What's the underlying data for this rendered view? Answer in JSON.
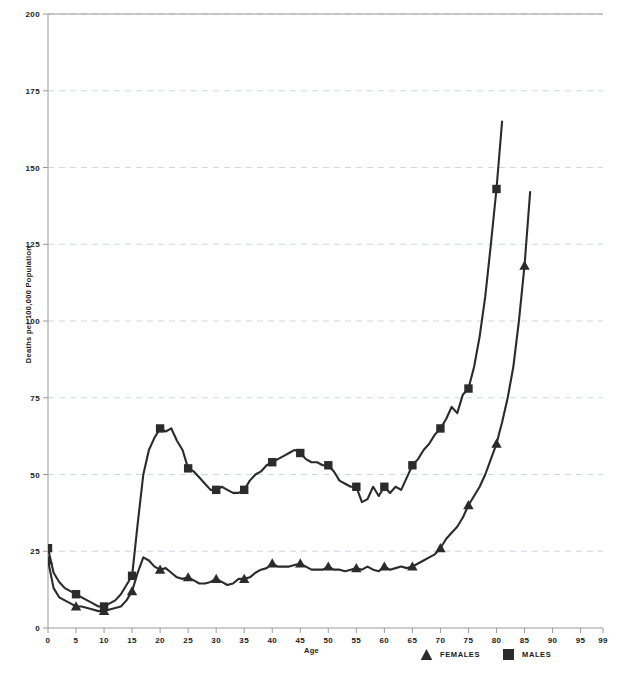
{
  "chart_data": {
    "type": "line",
    "title": "",
    "xlabel": "Age",
    "ylabel": "Deaths per 100,000 Population",
    "xlim": [
      0,
      99
    ],
    "ylim": [
      0,
      200
    ],
    "grid": true,
    "grid_axis": "y",
    "legend_position": "bottom-right",
    "xticks": [
      0,
      5,
      10,
      15,
      20,
      25,
      30,
      35,
      40,
      45,
      50,
      55,
      60,
      65,
      70,
      75,
      80,
      85,
      90,
      95,
      99
    ],
    "xticklabels": [
      "0",
      "5",
      "10",
      "15",
      "20",
      "25",
      "30",
      "35",
      "40",
      "45",
      "50",
      "55",
      "60",
      "65",
      "70",
      "75",
      "80",
      "85",
      "90",
      "95",
      "99"
    ],
    "yticks": [
      0,
      25,
      50,
      75,
      100,
      125,
      150,
      175,
      200
    ],
    "yticklabels": [
      "0",
      "25",
      "50",
      "75",
      "100",
      "125",
      "150",
      "175",
      "200"
    ],
    "series": [
      {
        "name": "FEMALES",
        "marker": "triangle",
        "color": "#2b2b2b",
        "marker_interval": 5,
        "x": [
          0,
          1,
          2,
          3,
          4,
          5,
          6,
          7,
          8,
          9,
          10,
          11,
          12,
          13,
          14,
          15,
          16,
          17,
          18,
          19,
          20,
          21,
          22,
          23,
          24,
          25,
          26,
          27,
          28,
          29,
          30,
          31,
          32,
          33,
          34,
          35,
          36,
          37,
          38,
          39,
          40,
          41,
          42,
          43,
          44,
          45,
          46,
          47,
          48,
          49,
          50,
          51,
          52,
          53,
          54,
          55,
          56,
          57,
          58,
          59,
          60,
          61,
          62,
          63,
          64,
          65,
          66,
          67,
          68,
          69,
          70,
          71,
          72,
          73,
          74,
          75,
          76,
          77,
          78,
          79,
          80,
          81,
          82,
          83,
          84,
          85,
          86
        ],
        "y": [
          22,
          13,
          10,
          9,
          8,
          7,
          7,
          6.5,
          6,
          5.5,
          5.5,
          6,
          6.5,
          7,
          9,
          12,
          18,
          23,
          22,
          20,
          19,
          19.5,
          18,
          16.5,
          16,
          16.5,
          15.5,
          14.5,
          14.5,
          15,
          16,
          15,
          14,
          14.5,
          16,
          16,
          16.5,
          18,
          19,
          19.5,
          21,
          20,
          20,
          20,
          20.5,
          21,
          20,
          19,
          19,
          19,
          20,
          19,
          19,
          18.5,
          19,
          19.5,
          19,
          20,
          19,
          18.5,
          20,
          19,
          19.5,
          20,
          19.5,
          20,
          21,
          22,
          23,
          24,
          26,
          29,
          31,
          33,
          36,
          40,
          43,
          46,
          50,
          55,
          60,
          67,
          75,
          85,
          100,
          118,
          142
        ]
      },
      {
        "name": "MALES",
        "marker": "square",
        "color": "#2b2b2b",
        "marker_interval": 5,
        "x": [
          0,
          1,
          2,
          3,
          4,
          5,
          6,
          7,
          8,
          9,
          10,
          11,
          12,
          13,
          14,
          15,
          16,
          17,
          18,
          19,
          20,
          21,
          22,
          23,
          24,
          25,
          26,
          27,
          28,
          29,
          30,
          31,
          32,
          33,
          34,
          35,
          36,
          37,
          38,
          39,
          40,
          41,
          42,
          43,
          44,
          45,
          46,
          47,
          48,
          49,
          50,
          51,
          52,
          53,
          54,
          55,
          56,
          57,
          58,
          59,
          60,
          61,
          62,
          63,
          64,
          65,
          66,
          67,
          68,
          69,
          70,
          71,
          72,
          73,
          74,
          75,
          76,
          77,
          78,
          79,
          80,
          81
        ],
        "y": [
          26,
          18,
          15,
          13,
          12,
          11,
          10,
          9,
          8,
          7,
          7,
          8,
          9,
          11,
          14,
          17,
          34,
          50,
          58,
          62,
          65,
          64,
          65,
          61,
          58,
          52,
          51,
          49,
          47,
          45,
          45,
          46,
          45,
          44,
          44,
          45,
          48,
          50,
          51,
          53,
          54,
          55,
          56,
          57,
          58,
          57,
          55,
          54,
          54,
          53,
          53,
          51,
          48,
          47,
          46,
          46,
          41,
          42,
          46,
          43,
          46,
          44,
          46,
          45,
          49,
          53,
          55,
          58,
          60,
          63,
          65,
          68,
          72,
          70,
          76,
          78,
          85,
          95,
          108,
          125,
          143,
          165
        ]
      }
    ]
  },
  "axis_titles": {
    "x": "Age",
    "y": "Deaths per 100,000 Population"
  },
  "legend": {
    "entries": [
      {
        "label": "FEMALES",
        "marker": "triangle-marker"
      },
      {
        "label": "MALES",
        "marker": "square-marker"
      }
    ]
  },
  "colors": {
    "line": "#2b2b2b",
    "grid": "#cfd8e3",
    "axis": "#9a9a9a",
    "text": "#1a1a1a"
  }
}
